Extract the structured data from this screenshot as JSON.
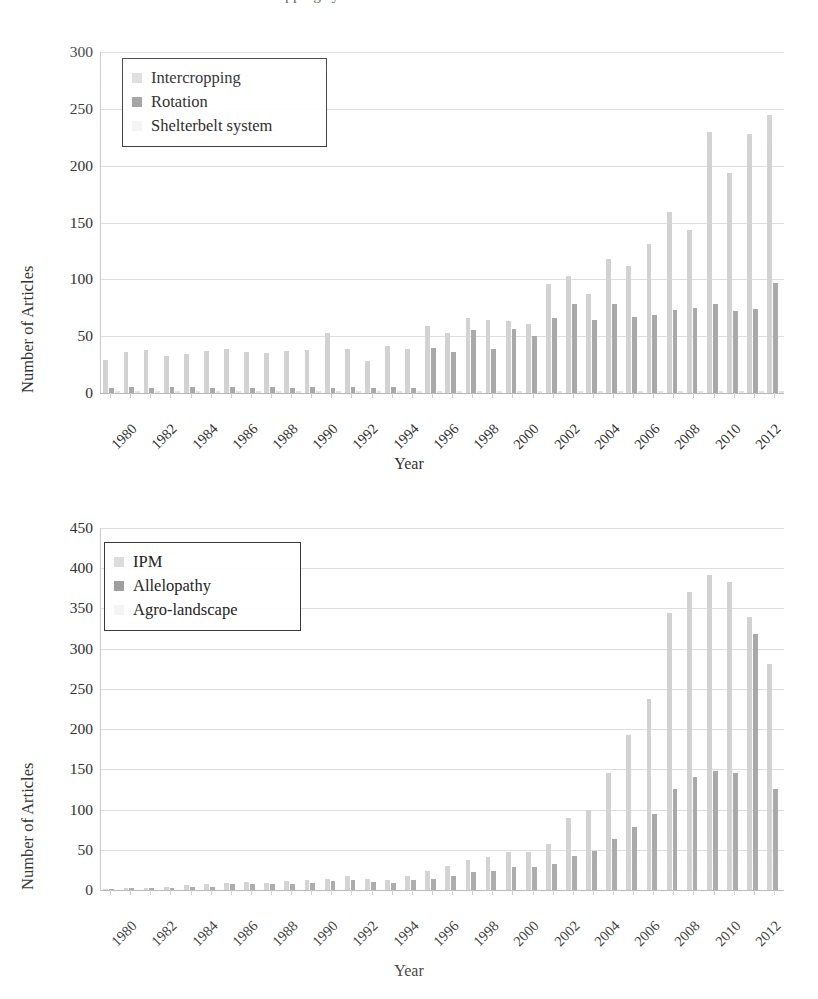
{
  "caption_sliver": "Numbers of articles on weed-related cropping systems",
  "figures": [
    {
      "id": "chart-top",
      "chart": {
        "type": "bar",
        "title": "",
        "xlabel": "Year",
        "ylabel": "Number of Articles",
        "ylim": [
          0,
          300
        ],
        "yticks": [
          0,
          50,
          100,
          150,
          200,
          250,
          300
        ],
        "grid": true,
        "legend_position": "top-left",
        "categories": [
          "1980",
          "1981",
          "1982",
          "1983",
          "1984",
          "1985",
          "1986",
          "1987",
          "1988",
          "1989",
          "1990",
          "1991",
          "1992",
          "1993",
          "1994",
          "1995",
          "1996",
          "1997",
          "1998",
          "1999",
          "2000",
          "2001",
          "2002",
          "2003",
          "2004",
          "2005",
          "2006",
          "2007",
          "2008",
          "2009",
          "2010",
          "2011",
          "2012",
          "2013"
        ],
        "tick_labels": [
          "1980",
          "",
          "1982",
          "",
          "1984",
          "",
          "1986",
          "",
          "1988",
          "",
          "1990",
          "",
          "1992",
          "",
          "1994",
          "",
          "1996",
          "",
          "1998",
          "",
          "2000",
          "",
          "2002",
          "",
          "2004",
          "",
          "2006",
          "",
          "2008",
          "",
          "2010",
          "",
          "2012",
          ""
        ],
        "series": [
          {
            "name": "Intercropping",
            "color": "#d2d2d2",
            "values": [
              29,
              5,
              38,
              6,
              34,
              7,
              39,
              8,
              35,
              9,
              38,
              10,
              39,
              11,
              53,
              12,
              28,
              13,
              41,
              14,
              39,
              15,
              59,
              16,
              63,
              17,
              66,
              18,
              64,
              19,
              61,
              20,
              96,
              21
            ]
          },
          {
            "name": "Rotation",
            "color": "#a9a9a9",
            "values": [
              4,
              36,
              5,
              33,
              5,
              37,
              5,
              36,
              5,
              37,
              5,
              36,
              5,
              40,
              6,
              55,
              4,
              39,
              7,
              56,
              8,
              66,
              9,
              64,
              10,
              78,
              12,
              103,
              14,
              117,
              15,
              159,
              17,
              230
            ]
          },
          {
            "name": "Shelterbelt system",
            "color": "#e3e3e3",
            "values": [
              2,
              2,
              2,
              2,
              2,
              2,
              2,
              2,
              2,
              2,
              2,
              2,
              2,
              2,
              2,
              2,
              2,
              2,
              2,
              2,
              2,
              2,
              2,
              2,
              2,
              2,
              2,
              2,
              2,
              2,
              2,
              2,
              2,
              2
            ]
          }
        ],
        "bar_heights": [
          [
            29,
            4,
            2
          ],
          [
            36,
            5,
            2
          ],
          [
            38,
            4,
            2
          ],
          [
            33,
            5,
            2
          ],
          [
            34,
            5,
            2
          ],
          [
            37,
            4,
            2
          ],
          [
            39,
            5,
            2
          ],
          [
            36,
            4,
            2
          ],
          [
            35,
            5,
            2
          ],
          [
            37,
            4,
            2
          ],
          [
            38,
            5,
            2
          ],
          [
            53,
            4,
            2
          ],
          [
            39,
            5,
            2
          ],
          [
            28,
            4,
            2
          ],
          [
            41,
            5,
            2
          ],
          [
            39,
            4,
            2
          ],
          [
            59,
            40,
            2
          ],
          [
            53,
            36,
            2
          ],
          [
            66,
            55,
            2
          ],
          [
            64,
            39,
            2
          ],
          [
            63,
            56,
            2
          ],
          [
            61,
            50,
            2
          ],
          [
            96,
            66,
            2
          ],
          [
            103,
            78,
            2
          ],
          [
            87,
            64,
            2
          ],
          [
            118,
            78,
            2
          ],
          [
            112,
            67,
            2
          ],
          [
            131,
            69,
            2
          ],
          [
            159,
            73,
            2
          ],
          [
            143,
            75,
            2
          ],
          [
            230,
            78,
            2
          ],
          [
            194,
            72,
            2
          ],
          [
            228,
            74,
            2
          ],
          [
            245,
            97,
            2
          ]
        ],
        "values_s3": [
          256
        ]
      }
    },
    {
      "id": "chart-bottom",
      "chart": {
        "type": "bar",
        "title": "",
        "xlabel": "Year",
        "ylabel": "Number of Articles",
        "ylim": [
          0,
          450
        ],
        "yticks": [
          0,
          50,
          100,
          150,
          200,
          250,
          300,
          350,
          400,
          450
        ],
        "grid": true,
        "legend_position": "top-left",
        "categories": [
          "1980",
          "1981",
          "1982",
          "1983",
          "1984",
          "1985",
          "1986",
          "1987",
          "1988",
          "1989",
          "1990",
          "1991",
          "1992",
          "1993",
          "1994",
          "1995",
          "1996",
          "1997",
          "1998",
          "1999",
          "2000",
          "2001",
          "2002",
          "2003",
          "2004",
          "2005",
          "2006",
          "2007",
          "2008",
          "2009",
          "2010",
          "2011",
          "2012",
          "2013"
        ],
        "tick_labels": [
          "1980",
          "",
          "1982",
          "",
          "1984",
          "",
          "1986",
          "",
          "1988",
          "",
          "1990",
          "",
          "1992",
          "",
          "1994",
          "",
          "1996",
          "",
          "1998",
          "",
          "2000",
          "",
          "2002",
          "",
          "2004",
          "",
          "2006",
          "",
          "2008",
          "",
          "2010",
          "",
          "2012",
          ""
        ],
        "series": [
          {
            "name": "IPM",
            "color": "#d2d2d2"
          },
          {
            "name": "Allelopathy",
            "color": "#a9a9a9"
          },
          {
            "name": "Agro-landscape",
            "color": "#e3e3e3"
          }
        ],
        "bar_heights": [
          [
            1,
            1,
            0
          ],
          [
            2,
            2,
            0
          ],
          [
            3,
            2,
            0
          ],
          [
            4,
            3,
            0
          ],
          [
            6,
            4,
            0
          ],
          [
            7,
            4,
            0
          ],
          [
            9,
            8,
            0
          ],
          [
            10,
            7,
            0
          ],
          [
            9,
            7,
            0
          ],
          [
            11,
            8,
            0
          ],
          [
            13,
            9,
            0
          ],
          [
            14,
            11,
            0
          ],
          [
            17,
            12,
            0
          ],
          [
            14,
            10,
            0
          ],
          [
            12,
            9,
            0
          ],
          [
            18,
            13,
            0
          ],
          [
            24,
            14,
            0
          ],
          [
            30,
            18,
            0
          ],
          [
            37,
            22,
            0
          ],
          [
            41,
            24,
            0
          ],
          [
            47,
            28,
            0
          ],
          [
            47,
            29,
            0
          ],
          [
            57,
            32,
            0
          ],
          [
            89,
            42,
            0
          ],
          [
            100,
            48,
            0
          ],
          [
            146,
            64,
            0
          ],
          [
            193,
            78,
            0
          ],
          [
            237,
            94,
            0
          ],
          [
            344,
            126,
            0
          ],
          [
            371,
            141,
            0
          ],
          [
            391,
            148,
            0
          ],
          [
            383,
            146,
            0
          ],
          [
            339,
            318,
            0
          ],
          [
            281,
            126,
            0
          ]
        ]
      }
    }
  ]
}
